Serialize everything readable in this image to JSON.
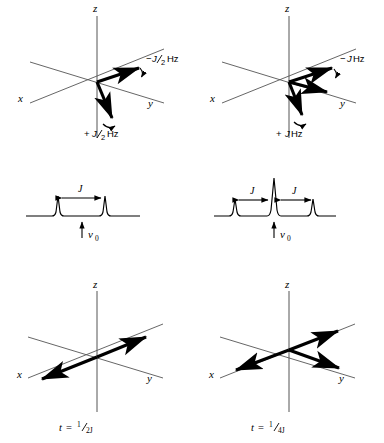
{
  "figure": {
    "background_color": "#ffffff",
    "ink_color": "#000000",
    "axis_color": "#555555"
  },
  "panels": [
    {
      "id": "top-left",
      "kind": "vector-diagram",
      "axes": {
        "z": "z",
        "x": "x",
        "y": "y"
      },
      "vectors": [
        {
          "name": "upfield-component",
          "label": "−J/2 Hz",
          "direction": "along +y (horizontal right)"
        },
        {
          "name": "downfield-component",
          "label": "+J/2 Hz",
          "direction": "down toward −z"
        }
      ],
      "annotations": [
        {
          "sign": "−",
          "value": "J",
          "denominator": "2",
          "unit": "Hz"
        },
        {
          "sign": "+",
          "value": "J",
          "denominator": "2",
          "unit": "Hz"
        }
      ]
    },
    {
      "id": "top-right",
      "kind": "vector-diagram",
      "axes": {
        "z": "z",
        "x": "x",
        "y": "y"
      },
      "vectors": [
        {
          "name": "upfield-component",
          "label": "−J Hz",
          "direction": "horizontal right"
        },
        {
          "name": "center-component",
          "label": "",
          "direction": "along +y"
        },
        {
          "name": "downfield-component",
          "label": "+J Hz",
          "direction": "down toward −z"
        }
      ],
      "annotations": [
        {
          "sign": "−",
          "value": "J",
          "denominator": "",
          "unit": "Hz"
        },
        {
          "sign": "+",
          "value": "J",
          "denominator": "",
          "unit": "Hz"
        }
      ]
    },
    {
      "id": "middle-left",
      "kind": "spectrum",
      "multiplicity": "doublet",
      "peak_count": 2,
      "relative_intensities": [
        1,
        1
      ],
      "coupling_label": "J",
      "coupling_arrows": 1,
      "center_label": "ν",
      "center_sub": "0"
    },
    {
      "id": "middle-right",
      "kind": "spectrum",
      "multiplicity": "triplet",
      "peak_count": 3,
      "relative_intensities": [
        1,
        2,
        1
      ],
      "coupling_label": "J",
      "coupling_arrows": 2,
      "center_label": "ν",
      "center_sub": "0"
    },
    {
      "id": "bottom-left",
      "kind": "vector-diagram",
      "axes": {
        "z": "z",
        "x": "x",
        "y": "y"
      },
      "vector_count": 2,
      "arrangement": "antiparallel along x axis",
      "caption": {
        "var": "t",
        "eq": "=",
        "numerator": "1",
        "denominator": "2J"
      }
    },
    {
      "id": "bottom-right",
      "kind": "vector-diagram",
      "axes": {
        "z": "z",
        "x": "x",
        "y": "y"
      },
      "vector_count": 3,
      "arrangement": "one toward +x, two toward +y and upper right",
      "caption": {
        "var": "t",
        "eq": "=",
        "numerator": "1",
        "denominator": "4J"
      }
    }
  ],
  "labels": {
    "axis_z": "z",
    "axis_x": "x",
    "axis_y": "y",
    "j": "J",
    "hz": "Hz",
    "minus": "−",
    "plus": "+",
    "nu": "ν",
    "nu_sub": "0",
    "t": "t",
    "equals": "=",
    "half_num": "1",
    "half_den_2j": "2J",
    "half_den_4j": "4J",
    "two": "2",
    "minus_j_half_hz": "−J/2 Hz",
    "plus_j_half_hz": "+J/2 Hz",
    "minus_j_hz": "−J Hz",
    "plus_j_hz": "+J Hz"
  }
}
